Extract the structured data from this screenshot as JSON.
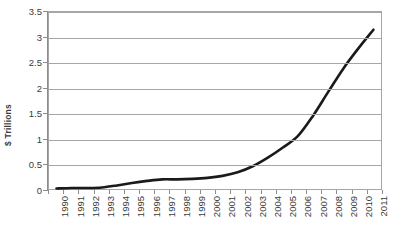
{
  "chart_data": {
    "type": "line",
    "title": "",
    "subtitle": "",
    "xlabel": "",
    "ylabel": "$ Trillions",
    "categories": [
      "1990",
      "1991",
      "1992",
      "1993",
      "1994",
      "1995",
      "1996",
      "1997",
      "1998",
      "1999",
      "2000",
      "2001",
      "2002",
      "2003",
      "2004",
      "2005",
      "2006",
      "2007",
      "2008",
      "2009",
      "2010",
      "2011"
    ],
    "values": [
      0.01,
      0.02,
      0.02,
      0.03,
      0.07,
      0.12,
      0.16,
      0.19,
      0.19,
      0.2,
      0.22,
      0.26,
      0.33,
      0.45,
      0.62,
      0.82,
      1.05,
      1.45,
      1.92,
      2.38,
      2.78,
      3.15
    ],
    "series": [
      {
        "name": "value",
        "values": [
          0.01,
          0.02,
          0.02,
          0.03,
          0.07,
          0.12,
          0.16,
          0.19,
          0.19,
          0.2,
          0.22,
          0.26,
          0.33,
          0.45,
          0.62,
          0.82,
          1.05,
          1.45,
          1.92,
          2.38,
          2.78,
          3.15
        ]
      }
    ],
    "ylim": [
      0,
      3.5
    ],
    "yticks": [
      "0",
      "0.5",
      "1",
      "1.5",
      "2",
      "2.5",
      "3",
      "3.5"
    ],
    "ytick_values": [
      0,
      0.5,
      1,
      1.5,
      2,
      2.5,
      3,
      3.5
    ],
    "grid": "horizontal",
    "legend": "none",
    "line_color": "#1a1a1a",
    "grid_color": "#a6a6a6",
    "axis_color": "#8c8c8c",
    "background": "#ffffff",
    "annotations": []
  }
}
